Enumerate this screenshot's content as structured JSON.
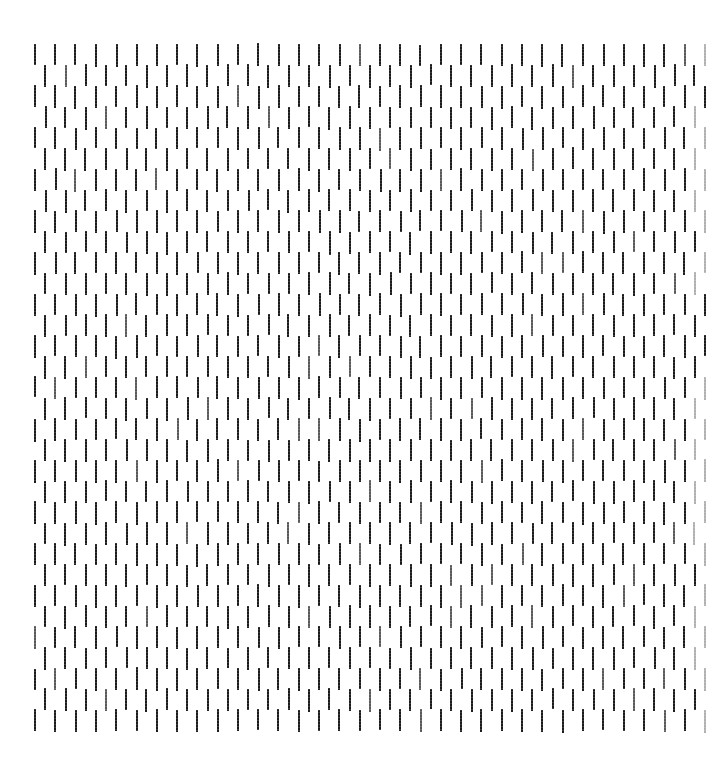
{
  "figure": {
    "canvas_width": 728,
    "canvas_height": 771,
    "background_color": "#ffffff"
  },
  "chart_data": {
    "type": "scatter",
    "subtitle": "",
    "xlabel": "",
    "ylabel": "",
    "grid": false,
    "legend_position": "none",
    "tick_labels_x": [],
    "tick_labels_y": [],
    "annotations": [],
    "xlim": [
      0,
      728
    ],
    "ylim": [
      0,
      771
    ],
    "marker": {
      "shape": "vertical-line-segment",
      "color": "#1a1a1a",
      "width_px": 2,
      "height_px": 22
    },
    "lattice": {
      "origin_x": 34,
      "origin_y": 44,
      "column_pitch": 20.3,
      "row_pitch": 20.8,
      "columns": 34,
      "rows": 33,
      "row_offset_px": 10.15,
      "offset_applies_to": "odd-rows",
      "right_edge_x": 705,
      "bottom_edge_y": 730
    },
    "series": [
      {
        "name": "even-rows",
        "row_indices": [
          0,
          2,
          4,
          6,
          8,
          10,
          12,
          14,
          16,
          18,
          20,
          22,
          24,
          26,
          28,
          30,
          32
        ],
        "x_offset": 0,
        "values": []
      },
      {
        "name": "odd-rows",
        "row_indices": [
          1,
          3,
          5,
          7,
          9,
          11,
          13,
          15,
          17,
          19,
          21,
          23,
          25,
          27,
          29,
          31
        ],
        "x_offset": 10.15,
        "values": []
      }
    ]
  }
}
